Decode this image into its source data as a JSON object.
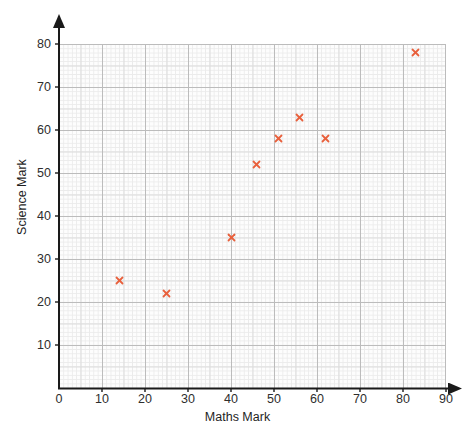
{
  "chart_data": {
    "type": "scatter",
    "title": "",
    "xlabel": "Maths Mark",
    "ylabel": "Science Mark",
    "xlim": [
      0,
      90
    ],
    "ylim": [
      0,
      80
    ],
    "xticks": [
      0,
      10,
      20,
      30,
      40,
      50,
      60,
      70,
      80,
      90
    ],
    "yticks": [
      0,
      10,
      20,
      30,
      40,
      50,
      60,
      70,
      80
    ],
    "grid": true,
    "grid_style": "graph-paper",
    "legend": null,
    "marker": "x",
    "marker_color": "#e8603c",
    "points": [
      {
        "x": 14,
        "y": 25
      },
      {
        "x": 25,
        "y": 22
      },
      {
        "x": 40,
        "y": 35
      },
      {
        "x": 46,
        "y": 52
      },
      {
        "x": 51,
        "y": 58
      },
      {
        "x": 56,
        "y": 63
      },
      {
        "x": 62,
        "y": 58
      },
      {
        "x": 83,
        "y": 78
      }
    ]
  },
  "axes": {
    "x": {
      "title": "Maths Mark",
      "ticks": [
        "0",
        "10",
        "20",
        "30",
        "40",
        "50",
        "60",
        "70",
        "80",
        "90"
      ]
    },
    "y": {
      "title": "Science Mark",
      "ticks": [
        "10",
        "20",
        "30",
        "40",
        "50",
        "60",
        "70",
        "80"
      ]
    }
  },
  "colors": {
    "marker": "#e8603c",
    "axis": "#1a1a1a",
    "grid_major": "#bcbcbc",
    "grid_medium": "#dcdcdc",
    "grid_minor": "#ebebeb",
    "plot_background": "#fdfdfd",
    "page_background": "#ffffff",
    "text": "#2e2e2e"
  }
}
